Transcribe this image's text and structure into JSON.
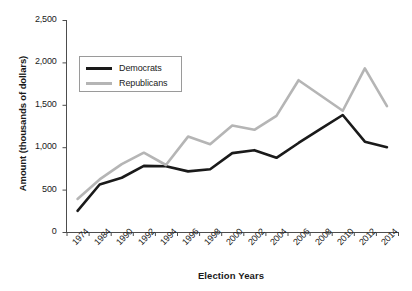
{
  "chart_data": {
    "type": "line",
    "title": "",
    "xlabel": "Election Years",
    "ylabel": "Amount (thousands of dollars)",
    "categories": [
      "1974",
      "1984",
      "1990",
      "1992",
      "1994",
      "1996",
      "1998",
      "2000",
      "2002",
      "2004",
      "2006",
      "2008",
      "2010",
      "2012",
      "2014"
    ],
    "series": [
      {
        "name": "Democrats",
        "color": "#1a1a1a",
        "values": [
          250,
          560,
          640,
          780,
          775,
          715,
          740,
          930,
          965,
          875,
          1050,
          1215,
          1380,
          1065,
          1000
        ]
      },
      {
        "name": "Republicans",
        "color": "#b5b5b5",
        "values": [
          390,
          620,
          800,
          935,
          790,
          1125,
          1035,
          1255,
          1205,
          1370,
          1790,
          1610,
          1430,
          1930,
          1485
        ]
      }
    ],
    "ylim": [
      0,
      2500
    ],
    "yticks": [
      0,
      500,
      1000,
      1500,
      2000,
      2500
    ],
    "ytick_labels": [
      "0",
      "500",
      "1,000",
      "1,500",
      "2,000",
      "2,500"
    ],
    "grid": false,
    "legend_position": "upper-left"
  },
  "legend": {
    "entries": [
      {
        "label": "Democrats"
      },
      {
        "label": "Republicans"
      }
    ]
  },
  "axes": {
    "x_title": "Election Years",
    "y_title": "Amount (thousands of dollars)"
  }
}
